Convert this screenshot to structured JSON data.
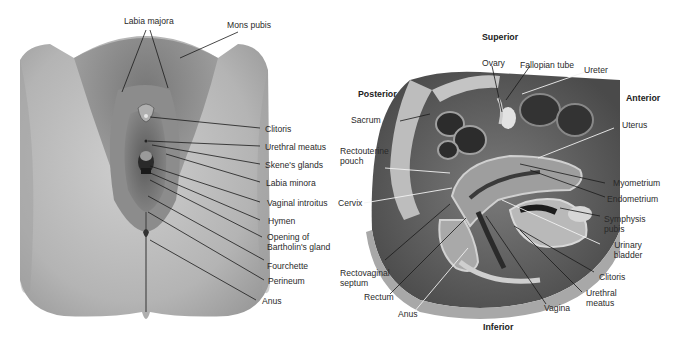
{
  "figure_left": {
    "title": "External female genitalia",
    "labels": [
      {
        "id": "labia-majora",
        "text": "Labia majora"
      },
      {
        "id": "mons-pubis",
        "text": "Mons pubis"
      },
      {
        "id": "clitoris",
        "text": "Clitoris"
      },
      {
        "id": "urethral-meatus",
        "text": "Urethral meatus"
      },
      {
        "id": "skenes-glands",
        "text": "Skene's glands"
      },
      {
        "id": "labia-minora",
        "text": "Labia minora"
      },
      {
        "id": "vaginal-introitus",
        "text": "Vaginal introitus"
      },
      {
        "id": "hymen",
        "text": "Hymen"
      },
      {
        "id": "opening-bartholins-gland",
        "text": "Opening of Bartholin's gland"
      },
      {
        "id": "fourchette",
        "text": "Fourchette"
      },
      {
        "id": "perineum",
        "text": "Perineum"
      },
      {
        "id": "anus",
        "text": "Anus"
      }
    ]
  },
  "figure_right": {
    "title": "Sagittal section of female pelvis",
    "orientation": {
      "superior": "Superior",
      "inferior": "Inferior",
      "posterior": "Posterior",
      "anterior": "Anterior"
    },
    "labels": [
      {
        "id": "ovary",
        "text": "Ovary"
      },
      {
        "id": "fallopian-tube",
        "text": "Fallopian tube"
      },
      {
        "id": "ureter",
        "text": "Ureter"
      },
      {
        "id": "sacrum",
        "text": "Sacrum"
      },
      {
        "id": "uterus",
        "text": "Uterus"
      },
      {
        "id": "rectouterine-pouch",
        "text": "Rectouterine pouch"
      },
      {
        "id": "myometrium",
        "text": "Myometrium"
      },
      {
        "id": "endometrium",
        "text": "Endometrium"
      },
      {
        "id": "cervix",
        "text": "Cervix"
      },
      {
        "id": "symphysis-pubis",
        "text": "Symphysis pubis"
      },
      {
        "id": "urinary-bladder",
        "text": "Urinary bladder"
      },
      {
        "id": "rectovaginal-septum",
        "text": "Rectovaginal septum"
      },
      {
        "id": "clitoris",
        "text": "Clitoris"
      },
      {
        "id": "urethral-meatus",
        "text": "Urethral meatus"
      },
      {
        "id": "rectum",
        "text": "Rectum"
      },
      {
        "id": "vagina",
        "text": "Vagina"
      },
      {
        "id": "anus",
        "text": "Anus"
      }
    ]
  },
  "colors": {
    "background": "#ffffff",
    "label_text": "#2a2a2a",
    "leader_line_dark": "#1a1a1a",
    "leader_line_light": "#f2f2f2",
    "tissue_light": "#c9c9c9",
    "tissue_mid": "#8e8e8e",
    "tissue_dark": "#3a3a3a"
  }
}
